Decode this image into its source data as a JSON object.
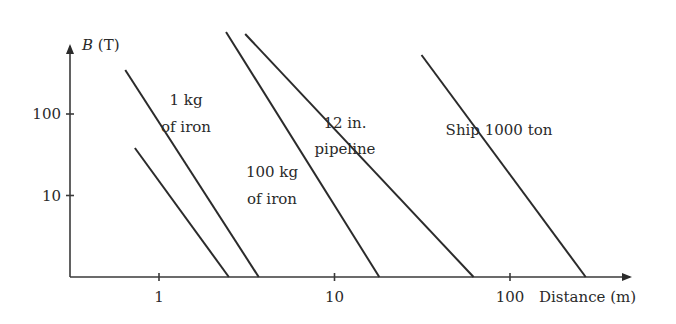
{
  "chart_data": {
    "type": "line",
    "title": "",
    "xlabel": "Distance (m)",
    "ylabel_italic": "B",
    "ylabel_unit": " (T)",
    "xscale": "log",
    "yscale": "log",
    "xlim": [
      0.31,
      300
    ],
    "ylim": [
      1,
      400
    ],
    "x_ticks": [
      {
        "value": 1,
        "label": "1"
      },
      {
        "value": 10,
        "label": "10"
      },
      {
        "value": 100,
        "label": "100"
      }
    ],
    "y_ticks": [
      {
        "value": 10,
        "label": "10"
      },
      {
        "value": 100,
        "label": "100"
      }
    ],
    "grid": false,
    "legend": "none",
    "series": [
      {
        "name": "small iron object",
        "label_lines": [],
        "points": [
          {
            "x": 0.55,
            "y": 88
          },
          {
            "x": 2.5,
            "y": 1
          }
        ]
      },
      {
        "name": "1 kg of iron",
        "label_lines": [
          "1 kg",
          "of iron"
        ],
        "points": [
          {
            "x": 0.5,
            "y": 800
          },
          {
            "x": 3.7,
            "y": 1
          }
        ]
      },
      {
        "name": "100 kg of iron",
        "label_lines": [
          "100 kg",
          "of iron"
        ],
        "points": [
          {
            "x": 1.9,
            "y": 2300
          },
          {
            "x": 18,
            "y": 1
          }
        ]
      },
      {
        "name": "12 in. pipeline",
        "label_lines": [
          "12 in.",
          "pipeline"
        ],
        "points": [
          {
            "x": 2.2,
            "y": 2100
          },
          {
            "x": 62,
            "y": 1
          }
        ]
      },
      {
        "name": "Ship 1000 ton",
        "label_lines": [
          "Ship 1000 ton"
        ],
        "points": [
          {
            "x": 24,
            "y": 1150
          },
          {
            "x": 270,
            "y": 1
          }
        ]
      }
    ]
  }
}
